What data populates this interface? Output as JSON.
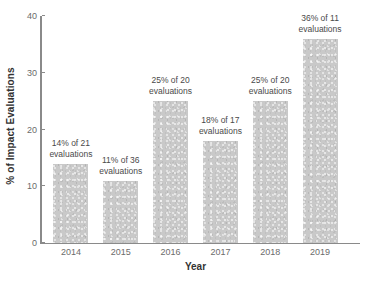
{
  "chart_data": {
    "type": "bar",
    "title": "",
    "xlabel": "Year",
    "ylabel": "% of Impact Evaluations",
    "categories": [
      "2014",
      "2015",
      "2016",
      "2017",
      "2018",
      "2019"
    ],
    "values": [
      14,
      11,
      25,
      18,
      25,
      36
    ],
    "ylim": [
      0,
      40
    ],
    "yticks": [
      0,
      10,
      20,
      30,
      40
    ],
    "ytick_labels": [
      "0",
      "10",
      "20",
      "30",
      "40"
    ],
    "grid": false,
    "legend": false,
    "bar_color": "#c9c9c9",
    "axis_color": "#8a8a8a",
    "text_color": "#4a4a4a",
    "annotations": [
      "14% of 21 evaluations",
      "11% of 36 evaluations",
      "25% of 20 evaluations",
      "18% of 17 evaluations",
      "25% of 20 evaluations",
      "36% of 11 evaluations"
    ],
    "denominators": [
      21,
      36,
      20,
      17,
      20,
      11
    ]
  }
}
